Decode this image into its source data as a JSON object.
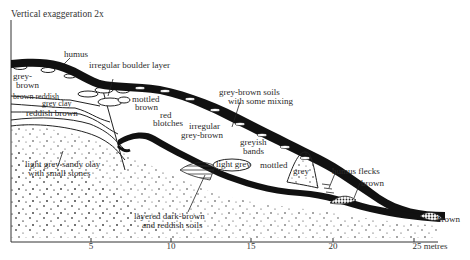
{
  "title": "Vertical exaggeration 2x",
  "axis": {
    "unit": "metres",
    "ticks": [
      {
        "value": "5",
        "x": 91
      },
      {
        "value": "10",
        "x": 171
      },
      {
        "value": "15",
        "x": 251
      },
      {
        "value": "20",
        "x": 333
      },
      {
        "value": "25 metres",
        "x": 430
      }
    ]
  },
  "labels": {
    "humus": "humus",
    "boulder": "irregular boulder layer",
    "grey_brown_1": "grey-",
    "grey_brown_2": "brown",
    "brown_reddish": "brown reddish",
    "grey_clay": "grey clay",
    "reddish_brown": "reddish brown",
    "mottled_brown_1": "mottled",
    "mottled_brown_2": "brown",
    "red_blotches_1": "red",
    "red_blotches_2": "blotches",
    "irregular_gb_1": "irregular",
    "irregular_gb_2": "grey-brown",
    "gb_soils_1": "grey-brown soils",
    "gb_soils_2": "with some mixing",
    "greyish_bands_1": "greyish",
    "greyish_bands_2": "bands",
    "light_grey": "light grey",
    "mottled": "mottled",
    "grey": "grey",
    "humus_flecks": "humus flecks",
    "brown_mid": "brown",
    "brown_right": "brown",
    "sandy_clay_1": "light grey sandy clay",
    "sandy_clay_2": "with small stones",
    "layered_1": "layered dark-brown",
    "layered_2": "and reddish soils"
  }
}
